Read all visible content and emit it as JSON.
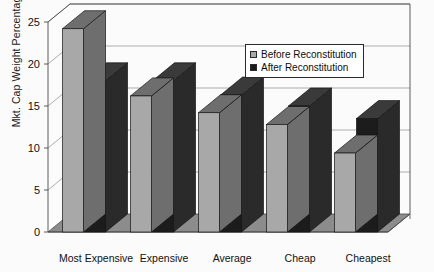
{
  "chart_data": {
    "type": "bar",
    "title": "",
    "subtitle": "",
    "xlabel": "",
    "ylabel": "Mkt. Cap Weight Percentage",
    "categories": [
      "Most Expensive",
      "Expensive",
      "Average",
      "Cheap",
      "Cheapest"
    ],
    "series": [
      {
        "name": "Before Reconstitution",
        "color": "#a8a8a8",
        "values": [
          24.2,
          16.2,
          14.2,
          12.8,
          9.4
        ]
      },
      {
        "name": "After Reconstitution",
        "color": "#1a1a1a",
        "values": [
          18.0,
          18.0,
          16.3,
          15.0,
          13.5
        ]
      }
    ],
    "ylim": [
      0,
      25
    ],
    "yticks": [
      0,
      5,
      10,
      15,
      20,
      25
    ],
    "ytick_labels": [
      "0",
      "5",
      "10",
      "15",
      "20",
      "25"
    ],
    "grid": true,
    "grid_axis": "y",
    "legend_position": "upper-right-inside",
    "style": "3d-bar",
    "background": "#ffffff"
  },
  "legend": {
    "entries": [
      {
        "label": "Before Reconstitution",
        "swatch": "#a8a8a8"
      },
      {
        "label": "After Reconstitution",
        "swatch": "#1a1a1a"
      }
    ]
  },
  "colors": {
    "series_before_front": "#a8a8a8",
    "series_before_top": "#6e6e6e",
    "series_before_side": "#6e6e6e",
    "series_after_front": "#1c1c1c",
    "series_after_top": "#3a3a3a",
    "series_after_side": "#2a2a2a",
    "floor": "#8c8c8c",
    "axis": "#4a4a4a",
    "grid": "#9a9a9a",
    "text": "#111111"
  }
}
